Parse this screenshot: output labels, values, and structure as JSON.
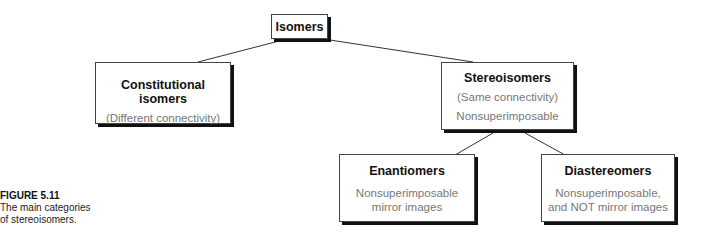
{
  "diagram": {
    "root": {
      "title": "Isomers"
    },
    "constitutional": {
      "title": "Constitutional isomers",
      "lines": [
        "(Different connectivity)"
      ]
    },
    "stereo": {
      "title": "Stereoisomers",
      "lines": [
        "(Same connectivity)",
        "Nonsuperimposable"
      ]
    },
    "enantiomers": {
      "title": "Enantiomers",
      "lines": [
        "Nonsuperimposable",
        "mirror images"
      ]
    },
    "diastereomers": {
      "title": "Diastereomers",
      "lines": [
        "Nonsuperimposable,",
        "and NOT mirror images"
      ]
    }
  },
  "caption": {
    "label": "FIGURE 5.11",
    "line1": "The main categories",
    "line2": "of stereoisomers."
  }
}
